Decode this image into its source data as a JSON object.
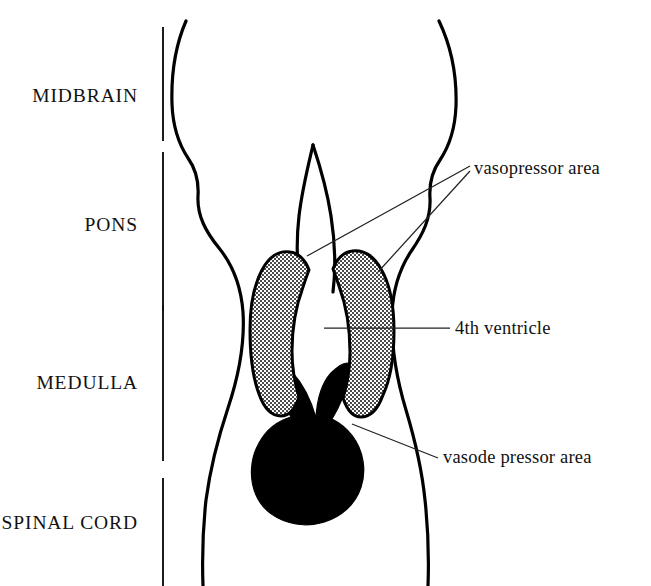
{
  "figure": {
    "background_color": "#ffffff",
    "ink_color": "#000000"
  },
  "region_labels": [
    {
      "id": "midbrain",
      "text": "MIDBRAIN",
      "x": 138,
      "y": 102
    },
    {
      "id": "pons",
      "text": "PONS",
      "x": 138,
      "y": 231
    },
    {
      "id": "medulla",
      "text": "MEDULLA",
      "x": 138,
      "y": 389
    },
    {
      "id": "spinal-cord",
      "text": "SPINAL CORD",
      "x": 138,
      "y": 529
    }
  ],
  "callout_labels": [
    {
      "id": "vasopressor",
      "text": "vasopressor  area",
      "x": 474,
      "y": 174
    },
    {
      "id": "fourth-ventricle",
      "text": "4th ventricle",
      "x": 455,
      "y": 334
    },
    {
      "id": "vasodepressor",
      "text": "vasode pressor  area",
      "x": 443,
      "y": 463
    }
  ],
  "divider_bars": [
    {
      "id": "divider-midbrain-top",
      "x": 163,
      "y1": 27,
      "y2": 141
    },
    {
      "id": "divider-pons",
      "x": 163,
      "y1": 152,
      "y2": 311
    },
    {
      "id": "divider-medulla",
      "x": 163,
      "y1": 305,
      "y2": 461
    },
    {
      "id": "divider-spinal-cord",
      "x": 163,
      "y1": 478,
      "y2": 586
    }
  ],
  "structures": [
    {
      "id": "brainstem-outline-left",
      "kind": "outline"
    },
    {
      "id": "brainstem-outline-right",
      "kind": "outline"
    },
    {
      "id": "midline-cleft",
      "kind": "outline"
    },
    {
      "id": "vasopressor-area-left",
      "kind": "stippled",
      "fill_pattern": "stipple"
    },
    {
      "id": "vasopressor-area-right",
      "kind": "stippled",
      "fill_pattern": "stipple"
    },
    {
      "id": "vasodepressor-area",
      "kind": "solid",
      "fill_color": "#000000"
    },
    {
      "id": "fourth-ventricle",
      "kind": "void",
      "fill_color": "#ffffff"
    }
  ],
  "leader_lines": [
    {
      "id": "leader-vasopressor-left",
      "from_x": 470,
      "from_y": 166,
      "to_x": 307,
      "to_y": 256
    },
    {
      "id": "leader-vasopressor-right",
      "from_x": 470,
      "from_y": 171,
      "to_x": 378,
      "to_y": 272
    },
    {
      "id": "leader-fourth-ventricle",
      "from_x": 450,
      "from_y": 328,
      "to_x": 324,
      "to_y": 328
    },
    {
      "id": "leader-vasodepressor",
      "from_x": 438,
      "from_y": 458,
      "to_x": 352,
      "to_y": 424
    }
  ]
}
